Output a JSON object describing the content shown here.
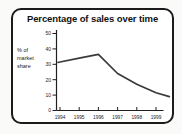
{
  "window": {
    "background": "#fafaf8"
  },
  "card": {
    "background": "#ffffff",
    "border_color": "#1b1b1b",
    "title": "Percentage of sales over time"
  },
  "chart_data": {
    "type": "line",
    "title": "Percentage of sales over time",
    "xlabel": "",
    "ylabel": "% of market share",
    "ylabel_lines": [
      "% of",
      "market",
      "share"
    ],
    "x_ticks": [
      "1994",
      "1995",
      "1996",
      "1997",
      "1998",
      "1999"
    ],
    "y_ticks": [
      0,
      10,
      20,
      30,
      40,
      50
    ],
    "ylim": [
      0,
      50
    ],
    "xlim": [
      1993.9,
      1999.75
    ],
    "grid": false,
    "legend": "none",
    "axis_color": "#1f1f1f",
    "line_color": "#3a3a3a",
    "tick_label_color": "#222222",
    "series": [
      {
        "name": "% of market share",
        "points": [
          {
            "x": 1993.9,
            "y": 31.3
          },
          {
            "x": 1994,
            "y": 31.5
          },
          {
            "x": 1995,
            "y": 34
          },
          {
            "x": 1996,
            "y": 36.5
          },
          {
            "x": 1997,
            "y": 24
          },
          {
            "x": 1998,
            "y": 17
          },
          {
            "x": 1999,
            "y": 11.5
          },
          {
            "x": 1999.7,
            "y": 9
          }
        ]
      }
    ]
  }
}
